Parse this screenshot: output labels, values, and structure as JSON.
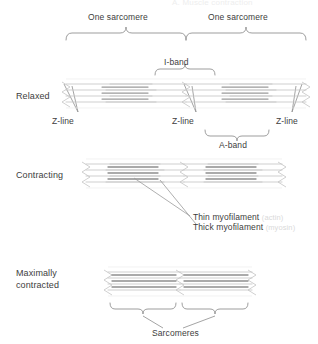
{
  "figure": {
    "top_title": "A. Muscle contraction",
    "labels": {
      "sarcomere_left": "One sarcomere",
      "sarcomere_right": "One sarcomere",
      "i_band": "I-band",
      "a_band": "A-band",
      "z_line_1": "Z-line",
      "z_line_2": "Z-line",
      "z_line_3": "Z-line",
      "sarcomeres": "Sarcomeres"
    },
    "states": [
      {
        "id": "relaxed",
        "label": "Relaxed"
      },
      {
        "id": "contracting",
        "label": "Contracting"
      },
      {
        "id": "max-contracted",
        "label_line1": "Maximally",
        "label_line2": "contracted"
      }
    ],
    "callouts": [
      {
        "id": "thin",
        "text": "Thin myofilament",
        "paren": "(actin)"
      },
      {
        "id": "thick",
        "text": "Thick myofilament",
        "paren": "(myosin)"
      }
    ],
    "colors": {
      "thin_filament": "#b9b9b9",
      "thick_filament": "#8e8e8e",
      "z_line": "#c9c9c9",
      "brace": "#8d8d8d",
      "text": "#3d3d3d",
      "faint_text": "#d9d9d9",
      "background": "#ffffff"
    }
  }
}
